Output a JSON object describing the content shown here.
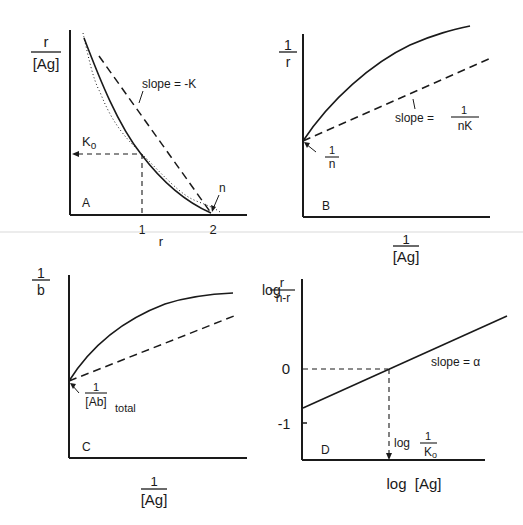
{
  "figure": {
    "panels": [
      {
        "id": "A",
        "panel_label": "A",
        "y_label_num": "r",
        "y_label_den": "[Ag]",
        "x_label": "r",
        "x_ticks": [
          "1",
          "2"
        ],
        "annotations": {
          "slope": "slope = -K",
          "k0": "K",
          "k0_sub": "o",
          "n": "n"
        },
        "curves": [
          "solid curve",
          "dashed straight line",
          "dotted curve"
        ]
      },
      {
        "id": "B",
        "panel_label": "B",
        "y_label_num": "1",
        "y_label_den": "r",
        "x_label_num": "1",
        "x_label_den": "[Ag]",
        "annotations": {
          "slope_prefix": "slope =",
          "slope_num": "1",
          "slope_den": "nK",
          "intercept_num": "1",
          "intercept_den": "n"
        }
      },
      {
        "id": "C",
        "panel_label": "C",
        "y_label_num": "1",
        "y_label_den": "b",
        "x_label_num": "1",
        "x_label_den": "[Ag]",
        "annotations": {
          "intercept_num": "1",
          "intercept_den": "[Ab]",
          "intercept_sub": "total"
        }
      },
      {
        "id": "D",
        "panel_label": "D",
        "y_label_prefix": "log",
        "y_label_num": "r",
        "y_label_den": "n-r",
        "x_label": "log  [Ag]",
        "y_ticks": [
          "0",
          "-1"
        ],
        "annotations": {
          "slope": "slope = α",
          "x_intercept_prefix": "log",
          "x_intercept_num": "1",
          "x_intercept_den": "K",
          "x_intercept_den_sub": "o"
        }
      }
    ]
  },
  "colors": {
    "ink": "#1a1a1a",
    "background": "#ffffff",
    "scan_artifact": "#ececec"
  }
}
